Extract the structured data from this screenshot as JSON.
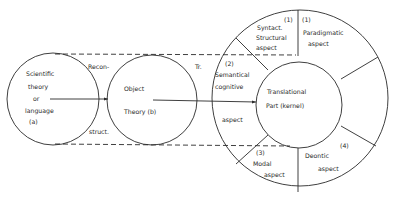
{
  "diagram": {
    "circle_a": {
      "lines": [
        "Scientific",
        "theory",
        "or",
        "language",
        "(a)"
      ]
    },
    "circle_b": {
      "lines": [
        "Object",
        "Theory (b)"
      ]
    },
    "connector_ab": {
      "top_label": "Recon-",
      "bottom_label": "struct."
    },
    "connector_bk": {
      "label": "Tr."
    },
    "kernel": {
      "lines": [
        "Translational",
        "Part   (kernel)"
      ]
    },
    "aspects": [
      {
        "number": "(1)",
        "lines": [
          "Syntact.",
          "Structural",
          "aspect"
        ]
      },
      {
        "number": "(1)",
        "lines": [
          "Paradigmatic",
          "aspect"
        ]
      },
      {
        "number": "(2)",
        "lines": [
          "Semantical",
          "cognitive",
          "aspect"
        ]
      },
      {
        "number": "(3)",
        "lines": [
          "Modal",
          "aspect"
        ]
      },
      {
        "number": "(4)",
        "lines": [
          "Deontic",
          "aspect"
        ]
      }
    ]
  }
}
